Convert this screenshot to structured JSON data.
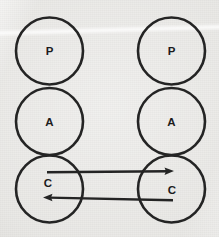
{
  "figure": {
    "background_color": "#e7e6e3",
    "ink_color": "#242424",
    "width": 219,
    "height": 237
  },
  "columns": [
    {
      "id": "left",
      "name": "left-agent",
      "center_x": 49.5,
      "nodes": [
        {
          "label": "P",
          "name": "presentation",
          "cx": 49.5,
          "cy": 51.0,
          "r": 33.5
        },
        {
          "label": "A",
          "name": "abstraction",
          "cx": 49.5,
          "cy": 121.5,
          "r": 33.5
        },
        {
          "label": "C",
          "name": "control",
          "cx": 49.5,
          "cy": 189.0,
          "r": 33.5
        }
      ]
    },
    {
      "id": "right",
      "name": "right-agent",
      "center_x": 171.5,
      "nodes": [
        {
          "label": "P",
          "name": "presentation",
          "cx": 171.5,
          "cy": 51.0,
          "r": 33.5
        },
        {
          "label": "A",
          "name": "abstraction",
          "cx": 171.5,
          "cy": 121.5,
          "r": 33.5
        },
        {
          "label": "C",
          "name": "control",
          "cx": 171.5,
          "cy": 189.0,
          "r": 33.5
        }
      ]
    }
  ],
  "connections": [
    {
      "name": "control-to-control-rightward",
      "direction": "left-to-right",
      "from": "left-control",
      "to": "right-control",
      "y": 172.0,
      "x_tail": 47.0,
      "x_tip": 174.0,
      "label": ""
    },
    {
      "name": "control-to-control-leftward",
      "direction": "right-to-left",
      "from": "right-control",
      "to": "left-control",
      "y": 198.0,
      "x_tail": 173.0,
      "x_tip": 43.0,
      "label": ""
    }
  ]
}
